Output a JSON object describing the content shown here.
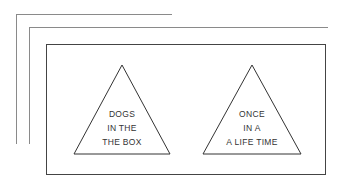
{
  "triangles": [
    {
      "lines": [
        "DOGS",
        "IN THE",
        "THE BOX"
      ]
    },
    {
      "lines": [
        "ONCE",
        "IN A",
        "A LIFE TIME"
      ]
    }
  ],
  "colors": {
    "outer_lines": "#8a8a8a",
    "frame": "#444444",
    "triangle": "#333333"
  }
}
